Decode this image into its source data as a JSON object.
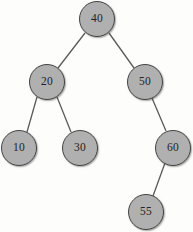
{
  "figure": {
    "kind": "binary-search-tree-diagram",
    "background_color": "#fdfdfb",
    "node_fill_color": "#b0b0b0",
    "node_stroke_color": "#454545",
    "edge_color": "#5a5a5a",
    "label_color": "#232323"
  },
  "tree": {
    "nodes": [
      {
        "id": "n40",
        "label": "40",
        "cx": 97,
        "cy": 19,
        "r": 18,
        "level": 0,
        "role": "root"
      },
      {
        "id": "n20",
        "label": "20",
        "cx": 47,
        "cy": 82,
        "r": 18,
        "level": 1,
        "role": "left-child"
      },
      {
        "id": "n50",
        "label": "50",
        "cx": 145,
        "cy": 82,
        "r": 18,
        "level": 1,
        "role": "right-child"
      },
      {
        "id": "n10",
        "label": "10",
        "cx": 19,
        "cy": 148,
        "r": 18,
        "level": 2,
        "role": "leaf"
      },
      {
        "id": "n30",
        "label": "30",
        "cx": 80,
        "cy": 148,
        "r": 18,
        "level": 2,
        "role": "leaf"
      },
      {
        "id": "n60",
        "label": "60",
        "cx": 173,
        "cy": 148,
        "r": 18,
        "level": 2,
        "role": "right-child"
      },
      {
        "id": "n55",
        "label": "55",
        "cx": 146,
        "cy": 212,
        "r": 18,
        "level": 3,
        "role": "leaf"
      }
    ],
    "edges": [
      {
        "id": "e40-20",
        "from": "n40",
        "to": "n20",
        "x1": 85,
        "y1": 33,
        "x2": 58,
        "y2": 68
      },
      {
        "id": "e40-50",
        "from": "n40",
        "to": "n50",
        "x1": 109,
        "y1": 33,
        "x2": 134,
        "y2": 68
      },
      {
        "id": "e20-10",
        "from": "n20",
        "to": "n10",
        "x1": 37,
        "y1": 97,
        "x2": 27,
        "y2": 132
      },
      {
        "id": "e20-30",
        "from": "n20",
        "to": "n30",
        "x1": 57,
        "y1": 97,
        "x2": 71,
        "y2": 132
      },
      {
        "id": "e50-60",
        "from": "n50",
        "to": "n60",
        "x1": 152,
        "y1": 98,
        "x2": 166,
        "y2": 131
      },
      {
        "id": "e60-55",
        "from": "n60",
        "to": "n55",
        "x1": 165,
        "y1": 163,
        "x2": 153,
        "y2": 196
      }
    ]
  }
}
